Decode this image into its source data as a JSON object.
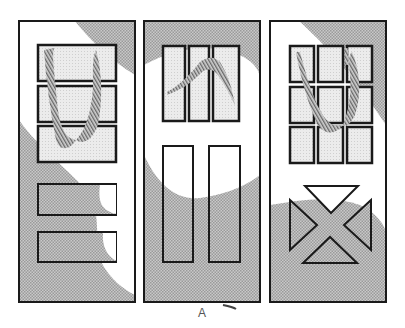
{
  "figure": {
    "caption": "A",
    "doors": [
      {
        "name": "door-1",
        "style": "five horizontal panels, top three glazed"
      },
      {
        "name": "door-2",
        "style": "three tall glazed lites over two long panels"
      },
      {
        "name": "door-3",
        "style": "nine-lite glazed top with X-pattern lower panel"
      }
    ]
  },
  "colors": {
    "outline": "#1a1a1a",
    "shade": "#b8b8b8",
    "glass": "#e6e6e6",
    "reflection": "#777777",
    "background": "#ffffff"
  }
}
